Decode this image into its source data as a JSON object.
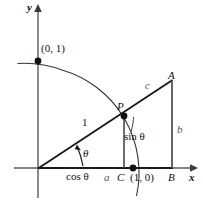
{
  "figure": {
    "type": "geometry-diagram",
    "width": 203,
    "height": 205,
    "background_color": "#ffffff",
    "stroke_color": "#1a1a1a",
    "axis_color": "#5a5a5a",
    "curve_color": "#2b2b2b"
  },
  "axes": {
    "x_label": "x",
    "y_label": "y",
    "origin": {
      "x": 38,
      "y": 168
    },
    "x_axis": {
      "x1": 14,
      "y1": 168,
      "x2": 196,
      "y2": 168
    },
    "y_axis": {
      "x1": 38,
      "y1": 196,
      "x2": 38,
      "y2": 6
    }
  },
  "points": [
    {
      "name": "origin",
      "label": "",
      "x": 38,
      "y": 168,
      "dot": false
    },
    {
      "name": "point-0-1",
      "label": "(0, 1)",
      "x": 38,
      "y": 61,
      "dot": true
    },
    {
      "name": "point-P",
      "label": "P",
      "x": 124,
      "y": 116,
      "dot": true
    },
    {
      "name": "point-1-0",
      "label": "(1, 0)",
      "x": 133,
      "y": 168,
      "dot": true
    },
    {
      "name": "point-A",
      "label": "A",
      "x": 172,
      "y": 80,
      "dot": false
    },
    {
      "name": "point-B",
      "label": "B",
      "x": 172,
      "y": 168,
      "dot": false
    },
    {
      "name": "point-C",
      "label": "C",
      "x": 124,
      "y": 168,
      "dot": false
    }
  ],
  "labels": {
    "y_axis": "y",
    "x_axis": "x",
    "point_0_1": "(0, 1)",
    "point_1_0": "(1, 0)",
    "point_P": "P",
    "point_A": "A",
    "point_B": "B",
    "point_C": "C",
    "hypotenuse_unit": "1",
    "side_c": "c",
    "side_b": "b",
    "side_a": "a",
    "cos_theta": "cos θ",
    "sin_theta": "sin θ",
    "theta": "θ"
  },
  "segments": [
    {
      "name": "ray-origin-to-A",
      "x1": 38,
      "y1": 168,
      "x2": 172,
      "y2": 80
    },
    {
      "name": "vertical-P-to-C",
      "x1": 124,
      "y1": 116,
      "x2": 124,
      "y2": 168
    },
    {
      "name": "vertical-A-to-B",
      "x1": 172,
      "y1": 80,
      "x2": 172,
      "y2": 168
    },
    {
      "name": "base-origin-to-B",
      "x1": 38,
      "y1": 168,
      "x2": 172,
      "y2": 168
    }
  ],
  "arc": {
    "name": "unit-circle-arc",
    "center": {
      "x": 38,
      "y": 168
    },
    "radius": 107,
    "description": "Quarter circle arc through (0, 1), P and (1, 0), extending slightly beyond each end"
  },
  "angle_marker": {
    "name": "theta-angle-arrow",
    "vertex": {
      "x": 38,
      "y": 168
    },
    "label": "θ"
  }
}
